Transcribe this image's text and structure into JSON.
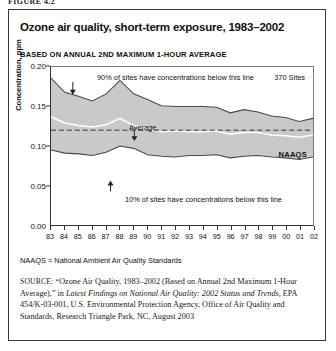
{
  "figure_label": "FIGURE 4.2",
  "title": "Ozone air quality, short-term exposure, 1983–2002",
  "subtitle": "BASED ON ANNUAL 2ND MAXIMUM 1-HOUR AVERAGE",
  "annotations": {
    "upper": "90% of sites have concentrations below this line",
    "sites": "370 Sites",
    "average": "Average",
    "lower": "10% of sites have concentrations below this line",
    "naaqs": "NAAQS"
  },
  "note": "NAAQS = National Ambient Air Quality Standards",
  "source": {
    "prefix": "SOURCE:",
    "part1": "“Ozone Air Quality, 1983–2002 (Based on Annual 2nd Maximum 1-Hour Average),” in ",
    "italic1": "Latest Findings on National Air Quality: 2002 Status and Trends,",
    "part2": " EPA 454/K-03-001, U.S. Environmental Protection Agency, Office of Air Quality and Standards, Research Triangle Park, NC, August 2003"
  },
  "colors": {
    "band": "#c9c9c9",
    "band_edge": "#4a4a4a",
    "average_line": "#ffffff",
    "naaqs_line": "#333333",
    "axis": "#333333",
    "frame": "#3a3a3a"
  },
  "chart_data": {
    "type": "area",
    "title": "Ozone air quality, short-term exposure, 1983–2002",
    "subtitle": "BASED ON ANNUAL 2ND MAXIMUM 1-HOUR AVERAGE",
    "xlabel": "",
    "ylabel": "Concentration, ppm",
    "ylim": [
      0.0,
      0.2
    ],
    "yticks": [
      "0.00",
      "0.05",
      "0.10",
      "0.15",
      "0.20"
    ],
    "ytick_values": [
      0.0,
      0.05,
      0.1,
      0.15,
      0.2
    ],
    "grid": false,
    "legend": "annotations-inline",
    "x": [
      1983,
      1984,
      1985,
      1986,
      1987,
      1988,
      1989,
      1990,
      1991,
      1992,
      1993,
      1994,
      1995,
      1996,
      1997,
      1998,
      1999,
      2000,
      2001,
      2002
    ],
    "xtick_labels": [
      "83",
      "84",
      "85",
      "86",
      "87",
      "88",
      "89",
      "90",
      "91",
      "92",
      "93",
      "94",
      "95",
      "96",
      "97",
      "98",
      "99",
      "00",
      "01",
      "02"
    ],
    "series": [
      {
        "name": "90th percentile",
        "label": "90% of sites have concentrations below this line",
        "values": [
          0.186,
          0.168,
          0.163,
          0.157,
          0.166,
          0.183,
          0.166,
          0.159,
          0.151,
          0.15,
          0.15,
          0.15,
          0.149,
          0.142,
          0.146,
          0.143,
          0.138,
          0.136,
          0.131,
          0.135
        ]
      },
      {
        "name": "Average",
        "label": "Average",
        "values": [
          0.137,
          0.129,
          0.126,
          0.124,
          0.127,
          0.135,
          0.126,
          0.122,
          0.118,
          0.119,
          0.118,
          0.118,
          0.119,
          0.115,
          0.117,
          0.117,
          0.114,
          0.113,
          0.111,
          0.114
        ]
      },
      {
        "name": "10th percentile",
        "label": "10% of sites have concentrations below this line",
        "values": [
          0.095,
          0.091,
          0.09,
          0.088,
          0.092,
          0.1,
          0.097,
          0.089,
          0.087,
          0.086,
          0.088,
          0.088,
          0.089,
          0.085,
          0.087,
          0.088,
          0.086,
          0.085,
          0.083,
          0.086
        ]
      }
    ],
    "reference_line": {
      "name": "NAAQS",
      "value": 0.12,
      "style": "dashed"
    },
    "annotation_sites": "370 Sites"
  }
}
